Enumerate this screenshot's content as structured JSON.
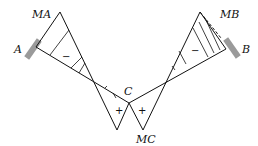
{
  "diagram": {
    "labels": {
      "MA": "MA",
      "A": "A",
      "C": "C",
      "MC": "MC",
      "MB": "MB",
      "B": "B"
    },
    "signs": {
      "left_negative": "−",
      "left_positive": "+",
      "right_positive": "+",
      "right_negative": "−"
    },
    "colors": {
      "line": "#111111",
      "support": "#9a9a9a"
    }
  }
}
